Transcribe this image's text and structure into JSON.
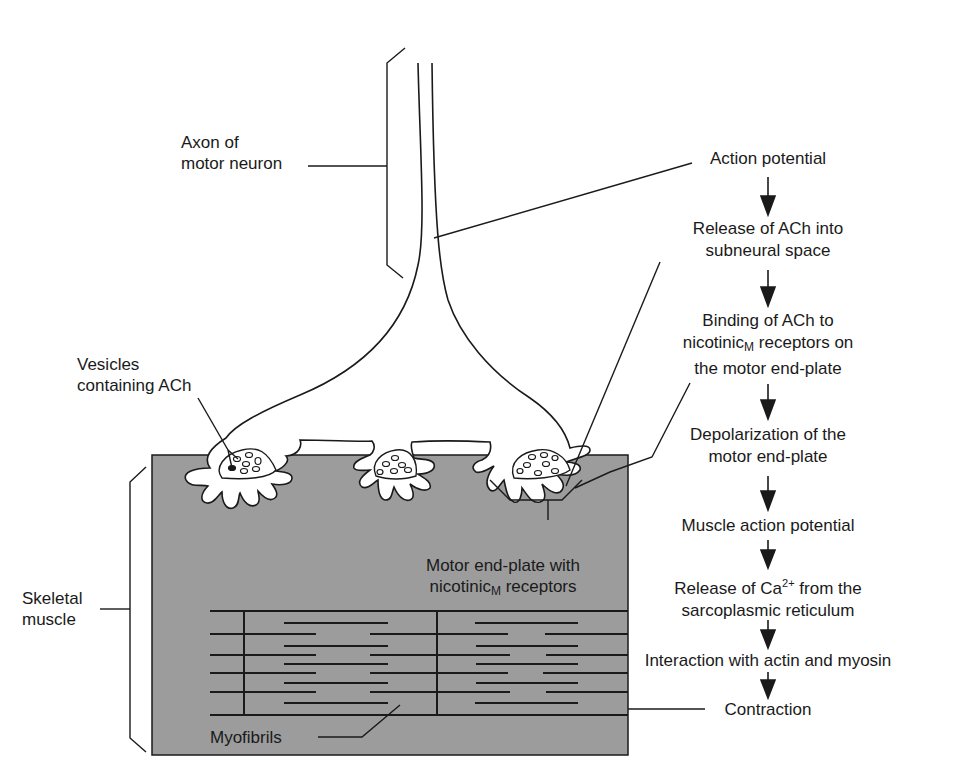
{
  "diagram": {
    "colors": {
      "muscle_fill": "#9c9c9c",
      "line": "#1a1a1a",
      "background": "#ffffff"
    },
    "labels": {
      "axon": {
        "line1": "Axon of",
        "line2": "motor neuron"
      },
      "vesicles": {
        "line1": "Vesicles",
        "line2": "containing ACh"
      },
      "skeletal_muscle": {
        "line1": "Skeletal",
        "line2": "muscle"
      },
      "end_plate": {
        "line1": "Motor end-plate with",
        "line2_main": "nicotinic",
        "line2_sub": "M",
        "line2_rest": " receptors"
      },
      "myofibrils": "Myofibrils"
    },
    "flow": {
      "steps": [
        {
          "line1": "Action potential"
        },
        {
          "line1": "Release of ACh into",
          "line2": "subneural space"
        },
        {
          "line1": "Binding of ACh to",
          "line2_main": "nicotinic",
          "line2_sub": "M",
          "line2_rest": " receptors on",
          "line3": "the motor end-plate"
        },
        {
          "line1": "Depolarization of the",
          "line2": "motor end-plate"
        },
        {
          "line1": "Muscle action potential"
        },
        {
          "line1_main": "Release of Ca",
          "line1_sup": "2+",
          "line1_rest": " from the",
          "line2": "sarcoplasmic reticulum"
        },
        {
          "line1": "Interaction with actin and myosin"
        },
        {
          "line1": "Contraction"
        }
      ],
      "arrow_icon": "down-arrow"
    }
  }
}
